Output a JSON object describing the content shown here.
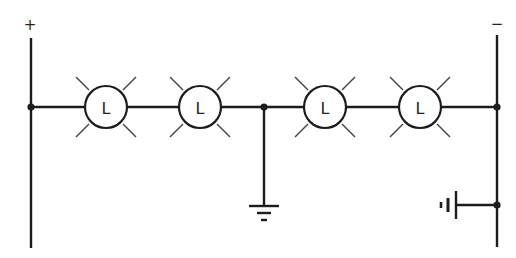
{
  "diagram": {
    "type": "circuit-schematic",
    "terminals": {
      "positive": {
        "label": "+",
        "x": 31
      },
      "negative": {
        "label": "−",
        "x": 497
      }
    },
    "bus_y": 107,
    "lamps": [
      {
        "id": "lamp-1",
        "label": "L",
        "cx": 106
      },
      {
        "id": "lamp-2",
        "label": "L",
        "cx": 200
      },
      {
        "id": "lamp-3",
        "label": "L",
        "cx": 325
      },
      {
        "id": "lamp-4",
        "label": "L",
        "cx": 420
      }
    ],
    "center_ground": {
      "symbol": "chassis-ground",
      "x": 264
    },
    "right_ground": {
      "symbol": "battery-cell-ground",
      "y": 205
    },
    "colors": {
      "line": "#1c1c1c",
      "background": "#ffffff"
    }
  }
}
